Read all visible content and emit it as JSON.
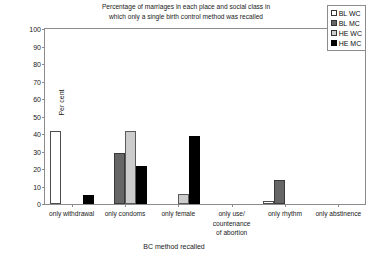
{
  "chart_data": {
    "type": "bar",
    "title": "Percentage of marriages in each place and social class in\nwhich only a single birth control method was recalled",
    "xlabel": "BC method recalled",
    "ylabel": "Per cent",
    "ylim": [
      0,
      100
    ],
    "ytick_step": 10,
    "yticks": [
      "100",
      "90",
      "80",
      "70",
      "60",
      "50",
      "40",
      "30",
      "20",
      "10",
      "0"
    ],
    "grid": false,
    "legend_position": "top-right",
    "categories": [
      "only withdrawal",
      "only condoms",
      "only female",
      "only use/\ncountenance\nof abortion",
      "only rhythm",
      "only abstinence"
    ],
    "series": [
      {
        "name": "BL WC",
        "color": "#ffffff",
        "values": [
          42,
          0,
          0,
          0,
          2,
          0
        ]
      },
      {
        "name": "BL MC",
        "color": "#666666",
        "values": [
          0,
          29,
          0,
          0,
          14,
          0
        ]
      },
      {
        "name": "HE WC",
        "color": "#cccccc",
        "values": [
          0,
          42,
          6,
          0,
          0,
          0
        ]
      },
      {
        "name": "HE MC",
        "color": "#000000",
        "values": [
          5,
          22,
          39,
          0,
          0,
          0
        ]
      }
    ]
  }
}
